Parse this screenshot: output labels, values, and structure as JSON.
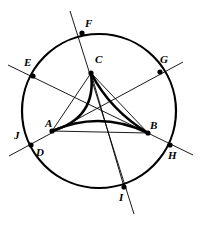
{
  "figure": {
    "background_color": "#ffffff",
    "stroke_color": "#000000",
    "circle": {
      "cx": 99,
      "cy": 111,
      "r": 77,
      "stroke_width": 2.2
    },
    "labels": [
      {
        "id": "A",
        "text": "A",
        "x": 45,
        "y": 118
      },
      {
        "id": "B",
        "text": "B",
        "x": 150,
        "y": 120
      },
      {
        "id": "C",
        "text": "C",
        "x": 95,
        "y": 54
      },
      {
        "id": "D",
        "text": "D",
        "x": 36,
        "y": 147
      },
      {
        "id": "E",
        "text": "E",
        "x": 24,
        "y": 57
      },
      {
        "id": "F",
        "text": "F",
        "x": 85,
        "y": 18
      },
      {
        "id": "G",
        "text": "G",
        "x": 160,
        "y": 54
      },
      {
        "id": "H",
        "text": "H",
        "x": 168,
        "y": 150
      },
      {
        "id": "I",
        "text": "I",
        "x": 119,
        "y": 192
      },
      {
        "id": "J",
        "text": "J",
        "x": 14,
        "y": 130
      }
    ],
    "vertices": [
      {
        "id": "A",
        "x": 52,
        "y": 131,
        "on_circle": false,
        "dot": true
      },
      {
        "id": "B",
        "x": 148,
        "y": 133,
        "on_circle": false,
        "dot": true
      },
      {
        "id": "C",
        "x": 91,
        "y": 73,
        "on_circle": false,
        "dot": true
      },
      {
        "id": "D",
        "x": 31,
        "y": 145,
        "on_circle": true,
        "dot": true
      },
      {
        "id": "E",
        "x": 33,
        "y": 76,
        "on_circle": true,
        "dot": true
      },
      {
        "id": "F",
        "x": 82,
        "y": 33,
        "on_circle": true,
        "dot": true
      },
      {
        "id": "G",
        "x": 160,
        "y": 72,
        "on_circle": true,
        "dot": true
      },
      {
        "id": "H",
        "x": 170,
        "y": 145,
        "on_circle": true,
        "dot": true
      },
      {
        "id": "I",
        "x": 124,
        "y": 187,
        "on_circle": true,
        "dot": true
      }
    ],
    "curved_triangle": {
      "stroke_width": 2.6,
      "arcs": [
        {
          "from": "A",
          "to": "C",
          "ctrl_x": 97,
          "ctrl_y": 118
        },
        {
          "from": "C",
          "to": "B",
          "ctrl_x": 110,
          "ctrl_y": 110
        },
        {
          "from": "A",
          "to": "B",
          "ctrl_x": 100,
          "ctrl_y": 110
        }
      ]
    },
    "chords": [
      {
        "id": "EH",
        "from": "E",
        "to": "H",
        "x1": 8,
        "y1": 65,
        "x2": 193,
        "y2": 155,
        "stroke_width": 0.9
      },
      {
        "id": "DG",
        "from": "D",
        "to": "G",
        "x1": 9,
        "y1": 156,
        "x2": 183,
        "y2": 62,
        "stroke_width": 0.9
      },
      {
        "id": "FI",
        "from": "F",
        "to": "I",
        "x1": 70,
        "y1": 11,
        "x2": 134,
        "y2": 214,
        "stroke_width": 0.9
      }
    ],
    "cevians": [
      {
        "id": "A-B",
        "from": "A",
        "to": "B",
        "stroke_width": 0.9
      },
      {
        "id": "C-B",
        "from": "C",
        "to": "B",
        "stroke_width": 0.9
      },
      {
        "id": "C-A",
        "from": "C",
        "to": "A",
        "stroke_width": 0.9
      },
      {
        "id": "C-I",
        "from": "C",
        "to": "I",
        "stroke_width": 0.9
      }
    ],
    "dot_radius": 2.6
  }
}
